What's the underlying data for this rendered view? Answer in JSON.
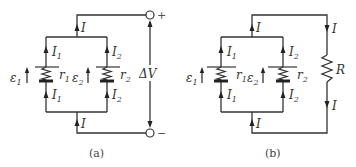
{
  "panels": [
    {
      "id": "a",
      "caption": "(a)",
      "labels": {
        "I_top": "I",
        "I_bottom": "I",
        "I1_top": "I",
        "I1_top_sub": "1",
        "I1_bot": "I",
        "I1_bot_sub": "1",
        "I2_top": "I",
        "I2_top_sub": "2",
        "I2_bot": "I",
        "I2_bot_sub": "2",
        "emf1": "ε",
        "emf1_sub": "1",
        "emf2": "ε",
        "emf2_sub": "2",
        "r1": "r",
        "r1_sub": "1",
        "r2": "r",
        "r2_sub": "2",
        "dV": "ΔV",
        "plus": "+",
        "minus": "−"
      }
    },
    {
      "id": "b",
      "caption": "(b)",
      "labels": {
        "I_top": "I",
        "I_bottom": "I",
        "I_right_top": "I",
        "I_right_bot": "I",
        "I1_top": "I",
        "I1_top_sub": "1",
        "I1_bot": "I",
        "I1_bot_sub": "1",
        "I2_top": "I",
        "I2_top_sub": "2",
        "I2_bot": "I",
        "I2_bot_sub": "2",
        "emf1": "ε",
        "emf1_sub": "1",
        "emf2": "ε",
        "emf2_sub": "2",
        "r1": "r",
        "r1_sub": "1",
        "r2": "r",
        "r2_sub": "2",
        "R": "R"
      }
    }
  ]
}
